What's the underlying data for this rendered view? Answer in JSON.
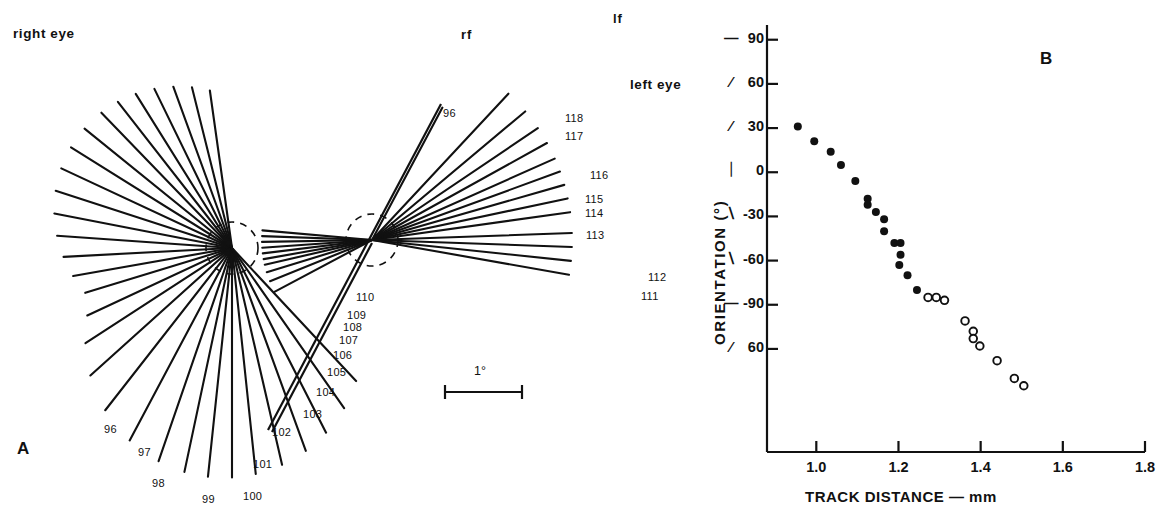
{
  "figure": {
    "panel_a": {
      "letter": "A",
      "right_eye_label": "right eye",
      "left_eye_label": "left eye",
      "rf_label": "rf",
      "lf_label": "lf",
      "scale_bar_label": "1°",
      "right_eye_center": {
        "x": 232,
        "y": 248
      },
      "left_eye_center": {
        "x": 372,
        "y": 240
      },
      "receptive_field_radius": 26,
      "numbered_units": [
        {
          "id": "96",
          "label": "96",
          "x": 104,
          "y": 424,
          "eye": "right"
        },
        {
          "id": "97",
          "label": "97",
          "x": 138,
          "y": 447,
          "eye": "right"
        },
        {
          "id": "98",
          "label": "98",
          "x": 152,
          "y": 478,
          "eye": "right"
        },
        {
          "id": "99",
          "label": "99",
          "x": 202,
          "y": 494,
          "eye": "right"
        },
        {
          "id": "100",
          "label": "100",
          "x": 243,
          "y": 491,
          "eye": "right"
        },
        {
          "id": "101",
          "label": "101",
          "x": 253,
          "y": 459,
          "eye": "right"
        },
        {
          "id": "102",
          "label": "102",
          "x": 272,
          "y": 427,
          "eye": "right"
        },
        {
          "id": "103",
          "label": "103",
          "x": 303,
          "y": 409,
          "eye": "right"
        },
        {
          "id": "104",
          "label": "104",
          "x": 316,
          "y": 387,
          "eye": "right"
        },
        {
          "id": "105",
          "label": "105",
          "x": 327,
          "y": 367,
          "eye": "right"
        },
        {
          "id": "106",
          "label": "106",
          "x": 333,
          "y": 350,
          "eye": "right"
        },
        {
          "id": "107",
          "label": "107",
          "x": 339,
          "y": 335,
          "eye": "right"
        },
        {
          "id": "108",
          "label": "108",
          "x": 343,
          "y": 322,
          "eye": "right"
        },
        {
          "id": "109",
          "label": "109",
          "x": 347,
          "y": 310,
          "eye": "right"
        },
        {
          "id": "110",
          "label": "110",
          "x": 356,
          "y": 292,
          "eye": "left"
        },
        {
          "id": "111",
          "label": "111",
          "x": 641,
          "y": 291,
          "eye": "left"
        },
        {
          "id": "112",
          "label": "112",
          "x": 648,
          "y": 272,
          "eye": "left"
        },
        {
          "id": "113",
          "label": "113",
          "x": 586,
          "y": 230,
          "eye": "left"
        },
        {
          "id": "114",
          "label": "114",
          "x": 585,
          "y": 208,
          "eye": "left"
        },
        {
          "id": "115",
          "label": "115",
          "x": 585,
          "y": 194,
          "eye": "left"
        },
        {
          "id": "116",
          "label": "116",
          "x": 590,
          "y": 170,
          "eye": "left"
        },
        {
          "id": "117",
          "label": "117",
          "x": 565,
          "y": 131,
          "eye": "left"
        },
        {
          "id": "118",
          "label": "118",
          "x": 565,
          "y": 113,
          "eye": "left"
        },
        {
          "id": "96b",
          "label": "96",
          "x": 443,
          "y": 108,
          "eye": "left"
        }
      ],
      "right_eye_fan_angles_deg": [
        98,
        104,
        110,
        116,
        122,
        128,
        134,
        141,
        148,
        155,
        162,
        169,
        176,
        183,
        190,
        197,
        205,
        213,
        222,
        232,
        242,
        251,
        258,
        264,
        270,
        276,
        283,
        290,
        297,
        305,
        313
      ],
      "left_eye_fan_angles_deg": [
        8,
        12,
        16,
        20,
        24,
        29,
        34,
        40,
        47,
        175,
        178,
        181,
        184,
        187,
        190,
        193,
        197,
        202,
        208,
        350,
        354,
        358,
        2,
        62
      ],
      "scale_bar": {
        "x1": 445,
        "x2": 522,
        "y": 392
      }
    },
    "panel_b": {
      "letter": "B"
    }
  },
  "chart_data": {
    "type": "scatter",
    "title": "",
    "xlabel": "TRACK  DISTANCE  —  mm",
    "ylabel": "ORIENTATION  (°)",
    "xlim": [
      0.88,
      1.8
    ],
    "ylim": [
      -190,
      100
    ],
    "grid": false,
    "legend": false,
    "xticks": [
      1.0,
      1.2,
      1.4,
      1.6,
      1.8
    ],
    "xticklabels": [
      "1.0",
      "1.2",
      "1.4",
      "1.6",
      "1.8"
    ],
    "yticks": [
      90,
      60,
      30,
      0,
      -30,
      -60,
      -90,
      -120
    ],
    "yticklabels": [
      "90",
      "60",
      "30",
      "0",
      "-30",
      "-60",
      "-90",
      "60"
    ],
    "ytick_orientation_glyphs": [
      "—",
      "∕",
      "∕",
      "｜",
      "∖",
      "∖",
      "—",
      "∕"
    ],
    "series": [
      {
        "name": "filled",
        "marker": "filled-circle",
        "color": "#111111",
        "points": [
          {
            "x": 0.955,
            "y": 31
          },
          {
            "x": 0.995,
            "y": 21
          },
          {
            "x": 1.035,
            "y": 14
          },
          {
            "x": 1.06,
            "y": 5
          },
          {
            "x": 1.095,
            "y": -6
          },
          {
            "x": 1.125,
            "y": -18
          },
          {
            "x": 1.125,
            "y": -22
          },
          {
            "x": 1.145,
            "y": -27
          },
          {
            "x": 1.165,
            "y": -32
          },
          {
            "x": 1.165,
            "y": -40
          },
          {
            "x": 1.19,
            "y": -48
          },
          {
            "x": 1.205,
            "y": -48
          },
          {
            "x": 1.205,
            "y": -56
          },
          {
            "x": 1.202,
            "y": -63
          },
          {
            "x": 1.222,
            "y": -70
          },
          {
            "x": 1.245,
            "y": -80
          }
        ]
      },
      {
        "name": "open",
        "marker": "open-circle",
        "color": "#111111",
        "points": [
          {
            "x": 1.272,
            "y": -85
          },
          {
            "x": 1.292,
            "y": -85
          },
          {
            "x": 1.312,
            "y": -87
          },
          {
            "x": 1.362,
            "y": -101
          },
          {
            "x": 1.382,
            "y": -108
          },
          {
            "x": 1.382,
            "y": -113
          },
          {
            "x": 1.398,
            "y": -118
          },
          {
            "x": 1.44,
            "y": -128
          },
          {
            "x": 1.482,
            "y": -140
          },
          {
            "x": 1.505,
            "y": -145
          }
        ]
      }
    ]
  }
}
